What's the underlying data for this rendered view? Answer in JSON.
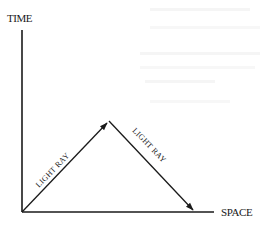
{
  "diagram": {
    "type": "spacetime-diagram",
    "axes": {
      "vertical_label": "TIME",
      "horizontal_label": "SPACE"
    },
    "rays": [
      {
        "label": "LIGHT RAY",
        "direction": "up-right"
      },
      {
        "label": "LIGHT RAY",
        "direction": "down-right"
      }
    ],
    "colors": {
      "ink": "#1a1a1a",
      "background": "#ffffff"
    }
  }
}
